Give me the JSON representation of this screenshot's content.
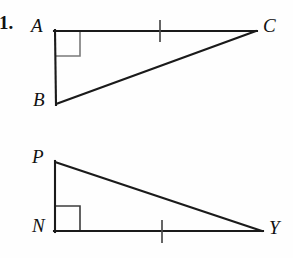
{
  "problem": {
    "number": "1."
  },
  "figure": {
    "background_color": "#fefefe",
    "stroke_color": "#1a1a1a",
    "right_angle_color": "#6f6f6f",
    "tick_color": "#555555",
    "triangles": [
      {
        "name": "triangle-abc",
        "vertices": [
          {
            "label": "A",
            "x": 55,
            "y": 31
          },
          {
            "label": "C",
            "x": 256,
            "y": 31
          },
          {
            "label": "B",
            "x": 56,
            "y": 104
          }
        ],
        "right_angle_at": "A",
        "tick_on_side": "AC",
        "tick_x": 160,
        "tick_y": 31
      },
      {
        "name": "triangle-pny",
        "vertices": [
          {
            "label": "P",
            "x": 55,
            "y": 162
          },
          {
            "label": "N",
            "x": 55,
            "y": 231
          },
          {
            "label": "Y",
            "x": 262,
            "y": 231
          }
        ],
        "right_angle_at": "N",
        "tick_on_side": "NY",
        "tick_x": 162,
        "tick_y": 231
      }
    ],
    "labels": {
      "a": "A",
      "b": "B",
      "c": "C",
      "p": "P",
      "n": "N",
      "y": "Y"
    }
  }
}
